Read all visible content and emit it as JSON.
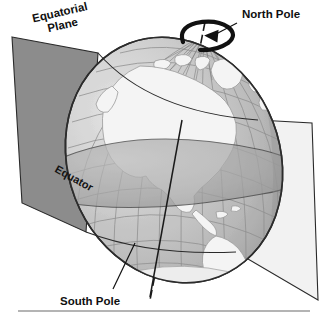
{
  "figure": {
    "type": "diagram",
    "background_color": "#ffffff",
    "width": 322,
    "height": 319
  },
  "labels": {
    "equatorial_plane_line1": "Equatorial",
    "equatorial_plane_line2": "Plane",
    "north_pole": "North Pole",
    "south_pole": "South Pole",
    "equator": "Equator"
  },
  "elements": {
    "globe_name": "earth-globe",
    "axis_name": "rotational-axis",
    "rotation_arrow_name": "rotation-direction-arrow",
    "equatorial_band_name": "equatorial-band",
    "plane_left_name": "equatorial-plane-left",
    "plane_right_name": "equatorial-plane-right",
    "leader_north_name": "north-pole-leader",
    "leader_south_name": "south-pole-leader",
    "baseline_name": "bottom-rule"
  },
  "colors": {
    "plane_left_fill": "#8c8c8c",
    "plane_right_fill": "#f2f2f2",
    "plane_outline": "#2a2a2a",
    "ocean_fill": "#c6c6c6",
    "ocean_fill_light": "#d6d6d6",
    "land_fill": "#f4f4f4",
    "land_outline": "#9a9a9a",
    "graticule": "#8e8e8e",
    "globe_outline": "#2c2c2c",
    "equator_band_fill": "#a9a9a9",
    "axis_color": "#1a1a1a",
    "arrow_color": "#111111",
    "label_color": "#101010",
    "rule_color": "#9b9b9b"
  },
  "geometry": {
    "globe_center_x": 174,
    "globe_center_y": 160,
    "globe_radius_x": 106,
    "globe_radius_y": 125,
    "axis_tilt_degrees": 23.5,
    "equator_label_rotation_degrees": 29,
    "plane_label_rotation_degrees": -13
  }
}
